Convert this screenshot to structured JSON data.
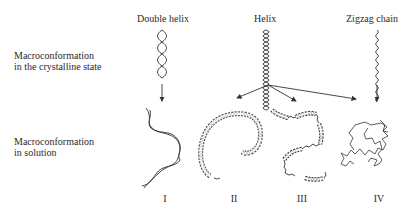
{
  "columns": {
    "double_helix": "Double helix",
    "helix": "Helix",
    "zigzag": "Zigzag chain"
  },
  "rows": {
    "crystalline": [
      "Macroconformation",
      "in  the crystalline state"
    ],
    "solution": [
      "Macroconformation",
      "in  solution"
    ]
  },
  "forms": [
    "I",
    "II",
    "III",
    "IV"
  ],
  "colors": {
    "stroke": "#333333",
    "text": "#2a2a2a",
    "background": "#ffffff"
  }
}
